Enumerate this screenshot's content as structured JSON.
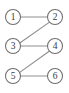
{
  "diagram": {
    "type": "node-link-diagram",
    "canvas": {
      "width": 69,
      "height": 93,
      "background": "#ffffff"
    },
    "style": {
      "node_fill": "#ffffff",
      "node_stroke": "#6e6e6e",
      "node_radius": 7.5,
      "edge_color": "#8f8f8f",
      "label_color": "#3a3a3a"
    },
    "nodes": [
      {
        "id": "n1",
        "label": "1",
        "cx": 13,
        "cy": 17,
        "column": "left",
        "row": 1
      },
      {
        "id": "n2",
        "label": "2",
        "cx": 55,
        "cy": 17,
        "column": "right",
        "row": 1
      },
      {
        "id": "n3",
        "label": "3",
        "cx": 13,
        "cy": 46,
        "column": "left",
        "row": 2
      },
      {
        "id": "n4",
        "label": "4",
        "cx": 55,
        "cy": 46,
        "column": "right",
        "row": 2
      },
      {
        "id": "n5",
        "label": "5",
        "cx": 13,
        "cy": 76,
        "column": "left",
        "row": 3
      },
      {
        "id": "n6",
        "label": "6",
        "cx": 55,
        "cy": 76,
        "column": "right",
        "row": 3
      }
    ],
    "edges": [
      {
        "id": "e1",
        "from": "n1",
        "to": "n2",
        "kind": "horizontal",
        "x1": 20.5,
        "y1": 17,
        "x2": 47.5,
        "y2": 17
      },
      {
        "id": "e2",
        "from": "n3",
        "to": "n2",
        "kind": "diagonal",
        "x1": 19.4,
        "y1": 43.2,
        "x2": 49.2,
        "y2": 22.4
      },
      {
        "id": "e3",
        "from": "n3",
        "to": "n4",
        "kind": "horizontal",
        "x1": 20.5,
        "y1": 46,
        "x2": 47.5,
        "y2": 46
      },
      {
        "id": "e4",
        "from": "n5",
        "to": "n4",
        "kind": "diagonal",
        "x1": 19.4,
        "y1": 72.6,
        "x2": 49.2,
        "y2": 51.2
      },
      {
        "id": "e5",
        "from": "n5",
        "to": "n6",
        "kind": "horizontal",
        "x1": 20.5,
        "y1": 76,
        "x2": 47.5,
        "y2": 76
      }
    ]
  }
}
